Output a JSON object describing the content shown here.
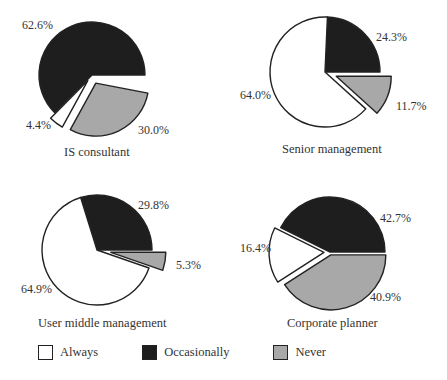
{
  "colors": {
    "always": "#ffffff",
    "occasionally": "#1e1e1e",
    "never": "#a8a8a8",
    "stroke": "#222222"
  },
  "legend": [
    {
      "key": "always",
      "label": "Always"
    },
    {
      "key": "occasionally",
      "label": "Occasionally"
    },
    {
      "key": "never",
      "label": "Never"
    }
  ],
  "charts": [
    {
      "title": "IS consultant",
      "labels": {
        "occasionally": "62.6%",
        "always": "4.4%",
        "never": "30.0%"
      }
    },
    {
      "title": "Senior management",
      "labels": {
        "occasionally": "24.3%",
        "always": "64.0%",
        "never": "11.7%"
      }
    },
    {
      "title": "User middle management",
      "labels": {
        "occasionally": "29.8%",
        "always": "64.9%",
        "never": "5.3%"
      }
    },
    {
      "title": "Corporate planner",
      "labels": {
        "occasionally": "42.7%",
        "always": "16.4%",
        "never": "40.9%"
      }
    }
  ],
  "chart_data": [
    {
      "type": "pie",
      "title": "IS consultant",
      "categories": [
        "Always",
        "Occasionally",
        "Never"
      ],
      "values": [
        4.4,
        62.6,
        30.0
      ]
    },
    {
      "type": "pie",
      "title": "Senior management",
      "categories": [
        "Always",
        "Occasionally",
        "Never"
      ],
      "values": [
        64.0,
        24.3,
        11.7
      ]
    },
    {
      "type": "pie",
      "title": "User middle management",
      "categories": [
        "Always",
        "Occasionally",
        "Never"
      ],
      "values": [
        64.9,
        29.8,
        5.3
      ]
    },
    {
      "type": "pie",
      "title": "Corporate planner",
      "categories": [
        "Always",
        "Occasionally",
        "Never"
      ],
      "values": [
        16.4,
        42.7,
        40.9
      ]
    }
  ]
}
